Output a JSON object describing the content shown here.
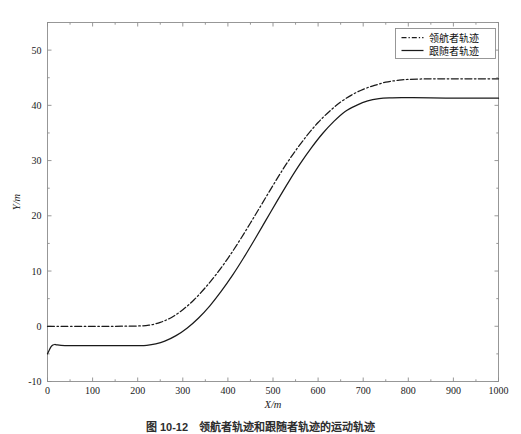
{
  "figure": {
    "caption": "图 10-12　领航者轨迹和跟随者轨迹的运动轨迹",
    "background_color": "#ffffff",
    "line_color": "#1a1a1a",
    "axis_color": "#8d8d8d"
  },
  "chart_data": {
    "type": "line",
    "title": "",
    "xlabel": "X/m",
    "ylabel": "Y/m",
    "xlim": [
      0,
      1000
    ],
    "ylim": [
      -10,
      55
    ],
    "xticks": [
      0,
      100,
      200,
      300,
      400,
      500,
      600,
      700,
      800,
      900,
      1000
    ],
    "xtick_labels": [
      "0",
      "100",
      "200",
      "300",
      "400",
      "500",
      "600",
      "700",
      "800",
      "900",
      "1000"
    ],
    "yticks": [
      -10,
      0,
      10,
      20,
      30,
      40,
      50
    ],
    "ytick_labels": [
      "-10",
      "0",
      "10",
      "20",
      "30",
      "40",
      "50"
    ],
    "grid": false,
    "legend_position": "upper right",
    "series": [
      {
        "name": "领航者轨迹",
        "style": "dashdot",
        "color": "#1a1a1a",
        "x": [
          0,
          20,
          50,
          100,
          150,
          200,
          225,
          250,
          275,
          300,
          325,
          350,
          375,
          400,
          425,
          450,
          475,
          500,
          525,
          550,
          575,
          600,
          625,
          650,
          675,
          700,
          725,
          750,
          775,
          800,
          850,
          900,
          950,
          1000
        ],
        "y": [
          0,
          0,
          0,
          0,
          0,
          0.05,
          0.2,
          0.7,
          1.6,
          3.0,
          4.8,
          7.0,
          9.5,
          12.3,
          15.4,
          18.7,
          22.1,
          25.5,
          28.8,
          31.8,
          34.5,
          36.9,
          38.9,
          40.6,
          41.9,
          42.9,
          43.6,
          44.2,
          44.5,
          44.7,
          44.8,
          44.8,
          44.8,
          44.8
        ]
      },
      {
        "name": "跟随者轨迹",
        "style": "solid",
        "color": "#1a1a1a",
        "x": [
          0,
          4,
          8,
          12,
          16,
          20,
          30,
          50,
          80,
          120,
          160,
          200,
          220,
          240,
          260,
          285,
          310,
          335,
          360,
          385,
          410,
          435,
          460,
          485,
          510,
          535,
          560,
          585,
          610,
          635,
          660,
          685,
          710,
          735,
          760,
          785,
          810,
          850,
          900,
          950,
          1000
        ],
        "y": [
          -5.0,
          -4.3,
          -3.7,
          -3.4,
          -3.3,
          -3.35,
          -3.45,
          -3.5,
          -3.5,
          -3.5,
          -3.5,
          -3.5,
          -3.45,
          -3.2,
          -2.7,
          -1.7,
          -0.3,
          1.5,
          3.7,
          6.3,
          9.2,
          12.4,
          15.8,
          19.3,
          22.8,
          26.2,
          29.4,
          32.3,
          34.9,
          37.1,
          38.9,
          40.0,
          40.8,
          41.2,
          41.35,
          41.4,
          41.4,
          41.35,
          41.3,
          41.3,
          41.3
        ]
      }
    ]
  },
  "legend": {
    "entries": [
      {
        "label": "领航者轨迹",
        "style": "dashdot"
      },
      {
        "label": "跟随者轨迹",
        "style": "solid"
      }
    ]
  }
}
